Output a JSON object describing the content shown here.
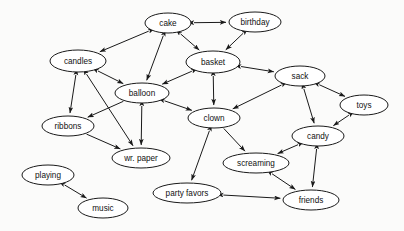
{
  "diagram": {
    "type": "directed-graph",
    "background_color": "#fbfbfa",
    "node_fill": "#ffffff",
    "node_stroke": "#1a1a1a",
    "edge_color": "#1a1a1a",
    "label_color": "#111111",
    "width": 404,
    "height": 231,
    "nodes": [
      {
        "id": "cake",
        "label": "cake",
        "cx": 168,
        "cy": 23,
        "rx": 23,
        "ry": 10
      },
      {
        "id": "birthday",
        "label": "birthday",
        "cx": 255,
        "cy": 22,
        "rx": 26,
        "ry": 10
      },
      {
        "id": "candles",
        "label": "candles",
        "cx": 78,
        "cy": 61,
        "rx": 28,
        "ry": 11
      },
      {
        "id": "basket",
        "label": "basket",
        "cx": 213,
        "cy": 62,
        "rx": 27,
        "ry": 11
      },
      {
        "id": "sack",
        "label": "sack",
        "cx": 300,
        "cy": 76,
        "rx": 25,
        "ry": 10
      },
      {
        "id": "balloon",
        "label": "balloon",
        "cx": 142,
        "cy": 93,
        "rx": 27,
        "ry": 10
      },
      {
        "id": "toys",
        "label": "toys",
        "cx": 364,
        "cy": 105,
        "rx": 24,
        "ry": 10
      },
      {
        "id": "clown",
        "label": "clown",
        "cx": 214,
        "cy": 118,
        "rx": 26,
        "ry": 10
      },
      {
        "id": "ribbons",
        "label": "ribbons",
        "cx": 68,
        "cy": 126,
        "rx": 26,
        "ry": 10
      },
      {
        "id": "candy",
        "label": "candy",
        "cx": 318,
        "cy": 136,
        "rx": 26,
        "ry": 10
      },
      {
        "id": "wr_paper",
        "label": "wr. paper",
        "cx": 141,
        "cy": 158,
        "rx": 29,
        "ry": 10
      },
      {
        "id": "screaming",
        "label": "screaming",
        "cx": 256,
        "cy": 163,
        "rx": 33,
        "ry": 10
      },
      {
        "id": "playing",
        "label": "playing",
        "cx": 48,
        "cy": 175,
        "rx": 26,
        "ry": 10
      },
      {
        "id": "party_favors",
        "label": "party favors",
        "cx": 187,
        "cy": 193,
        "rx": 34,
        "ry": 10
      },
      {
        "id": "friends",
        "label": "friends",
        "cx": 311,
        "cy": 200,
        "rx": 28,
        "ry": 10
      },
      {
        "id": "music",
        "label": "music",
        "cx": 103,
        "cy": 208,
        "rx": 25,
        "ry": 10
      }
    ],
    "edges": [
      {
        "from": "cake",
        "to": "birthday",
        "arrows": "both"
      },
      {
        "from": "cake",
        "to": "candles",
        "arrows": "both"
      },
      {
        "from": "cake",
        "to": "basket",
        "arrows": "both"
      },
      {
        "from": "cake",
        "to": "balloon",
        "arrows": "both"
      },
      {
        "from": "birthday",
        "to": "basket",
        "arrows": "both"
      },
      {
        "from": "candles",
        "to": "balloon",
        "arrows": "both"
      },
      {
        "from": "candles",
        "to": "ribbons",
        "arrows": "both"
      },
      {
        "from": "candles",
        "to": "wr_paper",
        "arrows": "both"
      },
      {
        "from": "basket",
        "to": "balloon",
        "arrows": "both"
      },
      {
        "from": "basket",
        "to": "sack",
        "arrows": "both"
      },
      {
        "from": "basket",
        "to": "clown",
        "arrows": "both"
      },
      {
        "from": "sack",
        "to": "toys",
        "arrows": "both"
      },
      {
        "from": "sack",
        "to": "candy",
        "arrows": "both"
      },
      {
        "from": "sack",
        "to": "clown",
        "arrows": "both"
      },
      {
        "from": "balloon",
        "to": "clown",
        "arrows": "both"
      },
      {
        "from": "balloon",
        "to": "wr_paper",
        "arrows": "both"
      },
      {
        "from": "balloon",
        "to": "ribbons",
        "arrows": "forward"
      },
      {
        "from": "ribbons",
        "to": "wr_paper",
        "arrows": "forward"
      },
      {
        "from": "toys",
        "to": "candy",
        "arrows": "both"
      },
      {
        "from": "clown",
        "to": "screaming",
        "arrows": "forward"
      },
      {
        "from": "clown",
        "to": "party_favors",
        "arrows": "both"
      },
      {
        "from": "candy",
        "to": "screaming",
        "arrows": "both"
      },
      {
        "from": "candy",
        "to": "friends",
        "arrows": "both"
      },
      {
        "from": "screaming",
        "to": "friends",
        "arrows": "both"
      },
      {
        "from": "party_favors",
        "to": "friends",
        "arrows": "both"
      },
      {
        "from": "playing",
        "to": "music",
        "arrows": "both"
      }
    ]
  }
}
